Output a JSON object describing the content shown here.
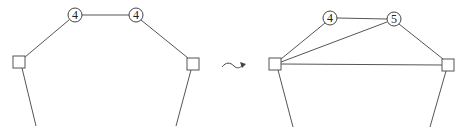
{
  "diagram": {
    "before": {
      "nodes": [
        {
          "id": "a",
          "type": "square",
          "x": 19,
          "y": 62
        },
        {
          "id": "b",
          "type": "circle",
          "label": "4",
          "x": 75,
          "y": 15
        },
        {
          "id": "c",
          "type": "circle",
          "label": "4",
          "x": 136,
          "y": 15
        },
        {
          "id": "d",
          "type": "square",
          "x": 193,
          "y": 64
        }
      ],
      "edges": [
        [
          "a",
          "b"
        ],
        [
          "b",
          "c"
        ],
        [
          "c",
          "d"
        ]
      ],
      "pendants": [
        {
          "from": "a",
          "to": [
            36,
            126
          ]
        },
        {
          "from": "d",
          "to": [
            176,
            126
          ]
        }
      ]
    },
    "transform_symbol": "~>",
    "after": {
      "nodes": [
        {
          "id": "a",
          "type": "square",
          "x": 275,
          "y": 64
        },
        {
          "id": "b",
          "type": "circle",
          "label": "4",
          "x": 330,
          "y": 18
        },
        {
          "id": "c",
          "type": "circle",
          "label": "5",
          "x": 394,
          "y": 19
        },
        {
          "id": "d",
          "type": "square",
          "x": 448,
          "y": 65
        }
      ],
      "edges": [
        [
          "a",
          "b"
        ],
        [
          "b",
          "c"
        ],
        [
          "a",
          "c"
        ],
        [
          "a",
          "d"
        ],
        [
          "c",
          "d"
        ]
      ],
      "pendants": [
        {
          "from": "a",
          "to": [
            293,
            127
          ]
        },
        {
          "from": "d",
          "to": [
            430,
            127
          ]
        }
      ]
    }
  },
  "labels": {
    "before_b": "4",
    "before_c": "4",
    "after_b": "4",
    "after_c": "5"
  }
}
